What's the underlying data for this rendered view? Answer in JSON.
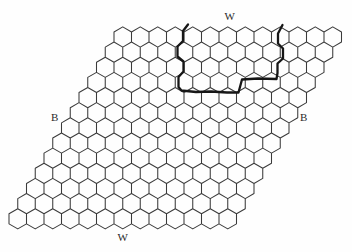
{
  "figure": {
    "background": "#fefefe",
    "labels": {
      "top": "W",
      "bottom": "W",
      "left": "B",
      "right": "B"
    },
    "grid": {
      "rows": 13,
      "cols": 13,
      "side": 10.1,
      "origin_cx": 122.75,
      "origin_cy": 37,
      "col_step": 17.5,
      "row_shift": -8.75,
      "row_step": 15.15,
      "line_color": "#3b3b3b",
      "line_width": 1.05
    },
    "outline": {
      "color": "#161616",
      "width": 2.3,
      "points": [
        [
          188,
          24.5
        ],
        [
          183,
          31
        ],
        [
          183,
          41
        ],
        [
          177.5,
          46.5
        ],
        [
          177.5,
          56.5
        ],
        [
          183.5,
          61.5
        ],
        [
          183.5,
          71.5
        ],
        [
          178.5,
          77
        ],
        [
          178.5,
          87
        ],
        [
          181.5,
          90.5
        ],
        [
          196,
          92
        ],
        [
          211,
          91.5
        ],
        [
          227,
          92.5
        ],
        [
          238.5,
          92.5
        ],
        [
          242,
          79.5
        ],
        [
          258,
          78.5
        ],
        [
          276.5,
          79
        ],
        [
          277.5,
          73
        ],
        [
          277.5,
          63.5
        ],
        [
          283,
          58.5
        ],
        [
          283,
          48.5
        ],
        [
          278,
          43.5
        ],
        [
          278,
          33.5
        ],
        [
          282.5,
          25
        ]
      ]
    },
    "canvas": {
      "width": 352,
      "height": 252
    }
  }
}
